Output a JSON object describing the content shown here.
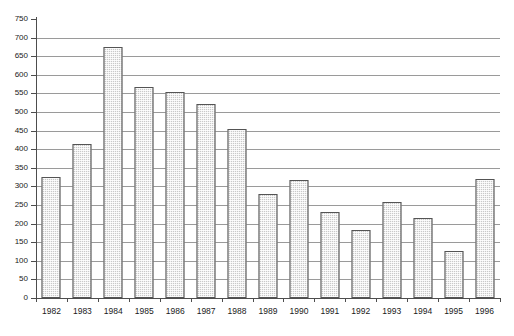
{
  "chart": {
    "title": "",
    "subtitle": "",
    "xlabel": "",
    "ylabel": ""
  },
  "chart_data": {
    "type": "bar",
    "title": "",
    "xlabel": "",
    "ylabel": "",
    "categories": [
      "1982",
      "1983",
      "1984",
      "1985",
      "1986",
      "1987",
      "1988",
      "1989",
      "1990",
      "1991",
      "1992",
      "1993",
      "1994",
      "1995",
      "1996"
    ],
    "values": [
      325,
      415,
      675,
      567,
      553,
      522,
      453,
      280,
      318,
      230,
      182,
      257,
      215,
      127,
      320
    ],
    "ylim": [
      0,
      750
    ],
    "ytick_step": 50,
    "yticks": [
      0,
      50,
      100,
      150,
      200,
      250,
      300,
      350,
      400,
      450,
      500,
      550,
      600,
      650,
      700,
      750
    ],
    "ytick_labels": [
      "0",
      "50",
      "100",
      "150",
      "200",
      "250",
      "300",
      "350",
      "400",
      "450",
      "500",
      "550",
      "600",
      "650",
      "700",
      "750"
    ],
    "grid": true,
    "grid_axis": "y",
    "legend": false,
    "legend_position": "none",
    "bar_fill": "#c9c9c9",
    "bar_edge": "#545454",
    "bar_pattern": "dotted-hatch",
    "axis_color": "#4d4d4d",
    "grid_color": "#9a9a9a",
    "background": "#ffffff",
    "series": [
      {
        "name": "",
        "values": [
          325,
          415,
          675,
          567,
          553,
          522,
          453,
          280,
          318,
          230,
          182,
          257,
          215,
          127,
          320
        ]
      }
    ]
  }
}
